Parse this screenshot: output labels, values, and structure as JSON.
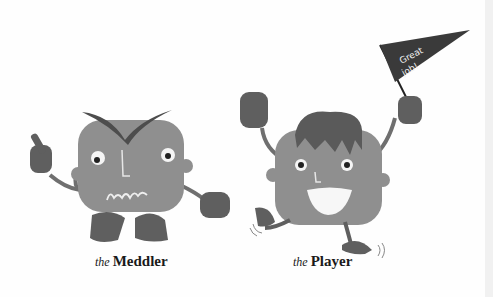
{
  "characters": [
    {
      "article": "the",
      "name": "Meddler"
    },
    {
      "article": "the",
      "name": "Player"
    }
  ],
  "pennant": {
    "line1": "Great",
    "line2": "job!"
  },
  "colors": {
    "body": "#8f8f8f",
    "dark": "#555555",
    "pennant": "#3a3a3a",
    "background": "#fefefe"
  }
}
